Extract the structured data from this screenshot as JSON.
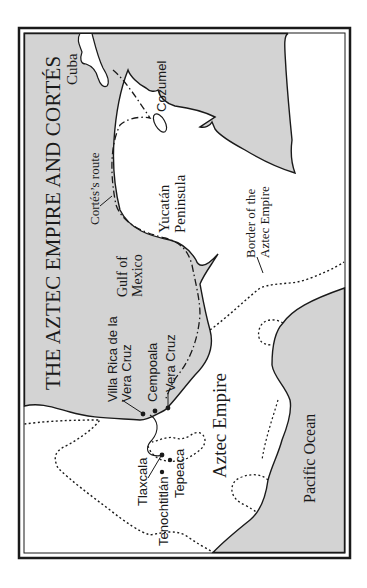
{
  "map": {
    "title": "THE AZTEC EMPIRE AND CORTÉS",
    "colors": {
      "water": "#d3d3d3",
      "land": "#ffffff",
      "line": "#1a1a1a",
      "frame": "#1a1a1a"
    },
    "orientation": "rotated 90 degrees counter-clockwise",
    "regions": {
      "cuba": "Cuba",
      "cozumel": "Cozumel",
      "yucatan": "Yucatán\nPeninsula",
      "gulf": "Gulf of\nMexico",
      "pacific": "Pacific Ocean",
      "aztec_empire": "Aztec Empire"
    },
    "annotations": {
      "route": "Cortés’s route",
      "border": "Border of the\nAztec Empire"
    },
    "cities": {
      "villa_rica": "Villa Rica de la\nVera Cruz",
      "cempoala": "Cempoala",
      "vera_cruz": "Vera Cruz",
      "tlaxcala": "Tlaxcala",
      "tenochtitlan": "Tenochtitlán",
      "tepeaca": "Tepeaca"
    },
    "legend": {
      "route_style": "dash-dot line",
      "border_style": "dotted line"
    }
  }
}
